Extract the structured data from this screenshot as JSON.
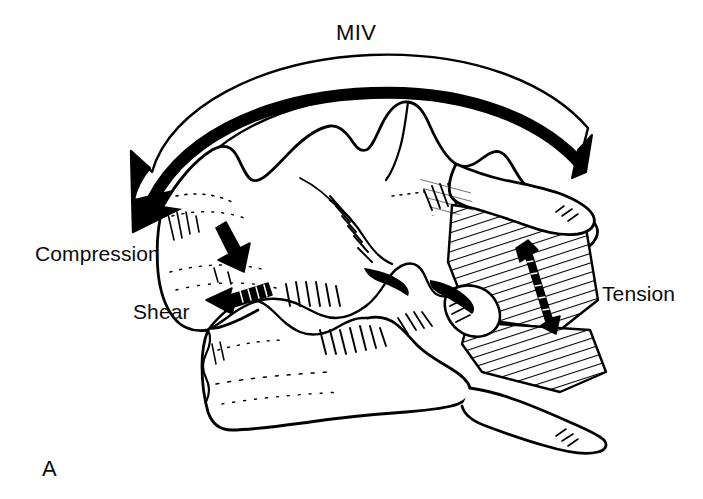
{
  "figure": {
    "panel_label": "A",
    "caption_labels": {
      "miv": "MIV",
      "compression": "Compression",
      "shear": "Shear",
      "tension": "Tension"
    },
    "background_color": "#ffffff",
    "ink_color": "#000000",
    "annotations": [
      {
        "name": "miv-arrow",
        "label": "MIV",
        "style": "thick-curved-outlined-arrow",
        "direction": "right-to-left-flexion",
        "arrowhead_end": "left"
      },
      {
        "name": "compression-arrow",
        "label": "Compression",
        "style": "small-solid-arrow",
        "direction": "down-right"
      },
      {
        "name": "shear-arrow",
        "label": "Shear",
        "style": "small-hatched-arrow",
        "direction": "left"
      },
      {
        "name": "tension-arrow",
        "label": "Tension",
        "style": "double-headed-arrow",
        "direction": "vertical"
      }
    ]
  }
}
